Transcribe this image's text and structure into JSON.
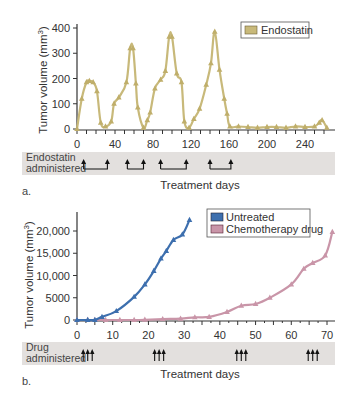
{
  "chart_data": [
    {
      "panel": "a.",
      "type": "line",
      "title": "",
      "xlabel": "Treatment days",
      "ylabel": "Tumor volume (mm³)",
      "xlim": [
        0,
        270
      ],
      "ylim": [
        0,
        400
      ],
      "xticks": [
        0,
        40,
        80,
        120,
        160,
        200,
        240
      ],
      "yticks": [
        0,
        100,
        200,
        300,
        400
      ],
      "grid": false,
      "legend_position": "top-right",
      "series": [
        {
          "name": "Endostatin",
          "color": "#c8b97a",
          "x": [
            0,
            5,
            10,
            13,
            17,
            21,
            25,
            30,
            36,
            39,
            44,
            52,
            56,
            59,
            62,
            64,
            70,
            74,
            77,
            82,
            88,
            93,
            97,
            100,
            105,
            110,
            113,
            118,
            123,
            129,
            136,
            141,
            145,
            150,
            155,
            158,
            161,
            170,
            180,
            190,
            200,
            210,
            220,
            230,
            240,
            250,
            255,
            258,
            263
          ],
          "values": [
            0,
            120,
            185,
            190,
            185,
            150,
            25,
            10,
            30,
            100,
            125,
            185,
            320,
            320,
            180,
            85,
            5,
            35,
            65,
            160,
            195,
            230,
            365,
            365,
            220,
            185,
            30,
            5,
            40,
            80,
            175,
            260,
            385,
            235,
            120,
            60,
            10,
            10,
            8,
            5,
            8,
            8,
            5,
            10,
            8,
            10,
            25,
            35,
            5
          ]
        }
      ],
      "annotations": {
        "band_label": "Endostatin administered",
        "dosing_periods": [
          [
            7,
            32
          ],
          [
            53,
            70
          ],
          [
            88,
            115
          ],
          [
            140,
            162
          ]
        ]
      }
    },
    {
      "panel": "b.",
      "type": "line",
      "title": "",
      "xlabel": "Treatment days",
      "ylabel": "Tumor volume (mm³)",
      "xlim": [
        0,
        72
      ],
      "ylim": [
        0,
        23000
      ],
      "xticks": [
        0,
        10,
        20,
        30,
        40,
        50,
        60,
        70
      ],
      "yticks": [
        0,
        5000,
        10000,
        15000,
        20000
      ],
      "ytick_labels": [
        "0",
        "5000",
        "10,000",
        "15,000",
        "20,000"
      ],
      "grid": false,
      "legend_position": "top-right",
      "series": [
        {
          "name": "Untreated",
          "color": "#3d6fae",
          "x": [
            0,
            3,
            5,
            7,
            11,
            16,
            19,
            21.5,
            23.5,
            25,
            27,
            29.5,
            31.5
          ],
          "values": [
            0,
            0,
            0,
            700,
            2000,
            5200,
            8000,
            11000,
            13800,
            15500,
            18000,
            19200,
            22500
          ]
        },
        {
          "name": "Chemotherapy drug",
          "color": "#c995a8",
          "x": [
            0,
            3,
            5,
            8,
            12,
            16,
            19,
            24,
            29,
            33,
            37,
            42,
            46,
            50,
            54,
            60,
            63.5,
            66,
            69.5,
            71.5
          ],
          "values": [
            0,
            0,
            0,
            0,
            0,
            0,
            50,
            200,
            300,
            600,
            700,
            1800,
            3200,
            3600,
            5000,
            8000,
            11500,
            12800,
            14500,
            19800
          ]
        }
      ],
      "annotations": {
        "band_label": "Drug administered",
        "dosing_days": [
          3,
          23,
          46,
          66
        ]
      }
    }
  ],
  "panel_a": {
    "label": "a.",
    "ylabel_main": "Tumor volume (mm",
    "ylabel_sup": "3",
    "ylabel_close": ")",
    "xlabel": "Treatment days",
    "legend": "Endostatin",
    "band_line1": "Endostatin",
    "band_line2": "administered",
    "xticks": [
      "0",
      "40",
      "80",
      "120",
      "160",
      "200",
      "240"
    ],
    "yticks": [
      "0",
      "100",
      "200",
      "300",
      "400"
    ]
  },
  "panel_b": {
    "label": "b.",
    "ylabel_main": "Tumor volume (mm",
    "ylabel_sup": "3",
    "ylabel_close": ")",
    "xlabel": "Treatment days",
    "legend_1": "Untreated",
    "legend_2": "Chemotherapy drug",
    "band_line1": "Drug",
    "band_line2": "administered",
    "xticks": [
      "0",
      "10",
      "20",
      "30",
      "40",
      "50",
      "60",
      "70"
    ],
    "yticks": [
      "0",
      "5000",
      "10,000",
      "15,000",
      "20,000"
    ]
  },
  "colors": {
    "endostatin": "#c8b97a",
    "endostatin_marker": "#bfae6a",
    "untreated": "#3d6fae",
    "chemo": "#c995a8",
    "band": "#e3e0de",
    "axis": "#333333"
  }
}
